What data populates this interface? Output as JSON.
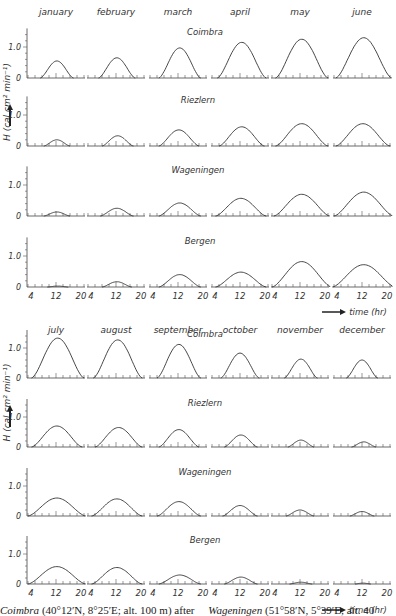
{
  "chart_data": {
    "type": "line",
    "ylabel": "H (cal cm^-2 min^-1)",
    "xlabel": "time (hr)",
    "x_ticks": [
      4,
      12,
      20
    ],
    "ylim": [
      0,
      1.5
    ],
    "y_ticks": [
      "0",
      "1.0"
    ],
    "grid": false,
    "stations": [
      "Coimbra",
      "Riezlern",
      "Wageningen",
      "Bergen"
    ],
    "months_top": [
      "january",
      "february",
      "march",
      "april",
      "may",
      "june"
    ],
    "months_bottom": [
      "july",
      "august",
      "september",
      "october",
      "november",
      "december"
    ],
    "series": [
      {
        "name": "Coimbra",
        "peak_values": [
          0.55,
          0.65,
          0.97,
          1.15,
          1.25,
          1.3,
          1.33,
          1.27,
          1.12,
          0.83,
          0.63,
          0.6
        ],
        "sunrise": [
          7.5,
          7,
          6.5,
          5.5,
          5,
          4.5,
          5,
          5.5,
          6,
          6.5,
          7.5,
          7.5
        ],
        "sunset": [
          17,
          17.5,
          18.5,
          19.5,
          20,
          20.5,
          20,
          19.5,
          18.5,
          17.5,
          17,
          16.5
        ]
      },
      {
        "name": "Riezlern",
        "peak_values": [
          0.2,
          0.33,
          0.52,
          0.62,
          0.72,
          0.72,
          0.7,
          0.65,
          0.58,
          0.4,
          0.23,
          0.17
        ],
        "sunrise": [
          8.5,
          8,
          6.5,
          6,
          5,
          4.5,
          5,
          6,
          6.5,
          7.5,
          8.5,
          9
        ],
        "sunset": [
          16,
          17,
          18,
          19,
          20,
          20,
          19.5,
          19.5,
          18,
          17,
          16,
          16
        ]
      },
      {
        "name": "Wageningen",
        "peak_values": [
          0.13,
          0.25,
          0.42,
          0.57,
          0.7,
          0.77,
          0.6,
          0.57,
          0.48,
          0.35,
          0.2,
          0.15
        ],
        "sunrise": [
          8.5,
          7.5,
          6.5,
          5,
          4.5,
          4,
          4,
          5,
          6,
          7,
          8,
          8.5
        ],
        "sunset": [
          16,
          17,
          18.5,
          19.5,
          20.5,
          21,
          20.5,
          19.5,
          18.5,
          17,
          16,
          15.5
        ]
      },
      {
        "name": "Bergen",
        "peak_values": [
          0.03,
          0.17,
          0.4,
          0.48,
          0.82,
          0.72,
          0.58,
          0.55,
          0.3,
          0.23,
          0.06,
          0.03
        ],
        "sunrise": [
          9.5,
          8,
          6.5,
          5,
          4,
          3.5,
          4,
          5,
          6.5,
          7.5,
          9,
          10
        ],
        "sunset": [
          15.5,
          16.5,
          18.5,
          19.5,
          21,
          21.5,
          20.5,
          19.5,
          18.5,
          17,
          15.5,
          14.5
        ]
      }
    ],
    "layout": {
      "rows_per_half": 4,
      "panels_per_row": 6,
      "halves": 2
    }
  },
  "labels": {
    "y_axis": "H (cal cm² min⁻¹)",
    "y_arrow": "arrow-up",
    "x_axis": "time (hr)",
    "tick_zero": "0",
    "tick_one": "1.0",
    "hours": [
      "4",
      "12",
      "20"
    ]
  },
  "caption": {
    "left_station": "Coimbra",
    "left_text": " (40°12′N, 8°25′E; alt. 100 m) after",
    "right_station": "Wageningen",
    "right_text": " (51°58′N, 5°39′E; alt. 40"
  }
}
